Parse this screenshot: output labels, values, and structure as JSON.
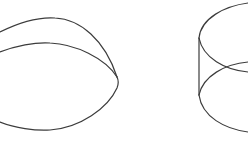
{
  "figure": {
    "shapes": [
      {
        "name": "hemisphere",
        "label": "Hemisphere"
      },
      {
        "name": "cylinder",
        "label": "Cylinder"
      }
    ],
    "stroke_color": "#3c3c3c",
    "background": "#ffffff"
  }
}
